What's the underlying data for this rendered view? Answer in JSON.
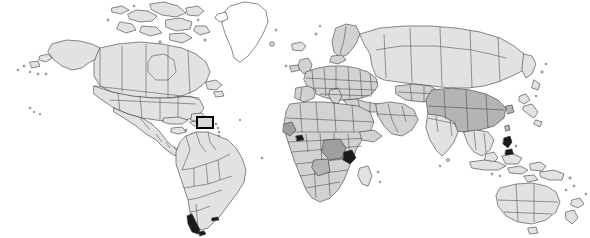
{
  "figure": {
    "kind": "world-map-locator",
    "title": "World map with highlighted region",
    "width": 590,
    "height": 238,
    "background_color": "#ffffff",
    "projection_note": "equirectangular world map, continents shaded grey with country borders"
  },
  "style": {
    "land_fill_light": "#e2e2e2",
    "land_fill_mid": "#d2d2d2",
    "land_fill_dark": "#b4b4b4",
    "land_fill_darker": "#9e9e9e",
    "land_fill_none": "#ffffff",
    "coastline_color": "#2b2b2b",
    "border_color": "#3a3a3a",
    "highlight_color": "#000000"
  },
  "highlight": {
    "label": "highlighted-region",
    "region_name": "Caribbean / Puerto Rico area",
    "x": 196,
    "y": 116,
    "width": 18,
    "height": 13,
    "border_width": 2,
    "border_color": "#000000",
    "fill_color": "#d8d8d8"
  },
  "regions": [
    {
      "name": "North America",
      "shade": "light"
    },
    {
      "name": "Greenland",
      "shade": "none"
    },
    {
      "name": "South America",
      "shade": "light"
    },
    {
      "name": "Europe",
      "shade": "mid"
    },
    {
      "name": "Africa",
      "shade": "mid"
    },
    {
      "name": "Asia",
      "shade": "light"
    },
    {
      "name": "Australia",
      "shade": "light"
    },
    {
      "name": "New Zealand",
      "shade": "light"
    }
  ],
  "labels": {
    "has_text_labels": false,
    "has_legend": false,
    "has_axes": false,
    "has_graticule": false
  }
}
